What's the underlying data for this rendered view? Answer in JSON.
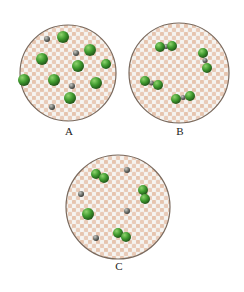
{
  "caption_fragment": "",
  "panels": [
    {
      "label": "A",
      "cx": 68,
      "cy": 73,
      "r": 48,
      "green": [
        [
          63,
          37,
          6
        ],
        [
          90,
          50,
          6
        ],
        [
          42,
          59,
          6
        ],
        [
          78,
          66,
          6
        ],
        [
          106,
          64,
          5
        ],
        [
          54,
          80,
          6
        ],
        [
          96,
          83,
          6
        ],
        [
          70,
          98,
          6
        ],
        [
          24,
          80,
          6
        ]
      ],
      "gray": [
        [
          47,
          39,
          3
        ],
        [
          76,
          53,
          3
        ],
        [
          72,
          86,
          3
        ],
        [
          52,
          107,
          3
        ]
      ]
    },
    {
      "label": "B",
      "cx": 179,
      "cy": 73,
      "r": 50,
      "pairs": [
        [
          160,
          47,
          172,
          46
        ],
        [
          203,
          53,
          207,
          68
        ],
        [
          145,
          81,
          158,
          85
        ],
        [
          176,
          99,
          190,
          96
        ]
      ]
    },
    {
      "label": "C",
      "cx": 118,
      "cy": 207,
      "r": 52,
      "pairs": [
        [
          96,
          174,
          104,
          178
        ],
        [
          143,
          190,
          145,
          199
        ],
        [
          118,
          233,
          126,
          237
        ]
      ],
      "green": [
        [
          88,
          214,
          6
        ]
      ],
      "gray": [
        [
          127,
          170,
          3
        ],
        [
          81,
          194,
          3
        ],
        [
          127,
          211,
          3
        ],
        [
          96,
          238,
          3
        ]
      ]
    }
  ],
  "labels": [
    {
      "text": "A",
      "x": 69,
      "y": 131
    },
    {
      "text": "B",
      "x": 180,
      "y": 131
    },
    {
      "text": "C",
      "x": 119,
      "y": 266
    }
  ],
  "colors": {
    "green": "#3f9a2e",
    "green_dark": "#2c6e1f",
    "gray": "#6f726d",
    "bead_pink": "#e8c8b4",
    "bead_white": "#f2f0ec",
    "rim": "#7a6a5e"
  }
}
